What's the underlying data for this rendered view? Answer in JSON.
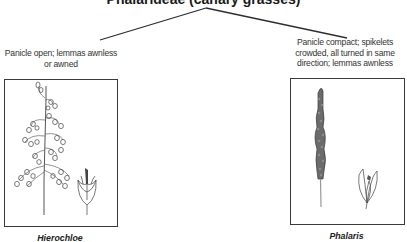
{
  "diagram": {
    "title": "Phalarideae (canary grasses)",
    "branches": [
      {
        "description_lines": [
          "Panicle open; lemmas awnless",
          "or awned"
        ],
        "genus": "Hierochloe"
      },
      {
        "description_lines": [
          "Panicle compact; spikelets",
          "crowded, all turned in same",
          "direction; lemmas awnless"
        ],
        "genus": "Phalaris"
      }
    ],
    "colors": {
      "line": "#2e2e2e",
      "box_border": "#3a3a3a",
      "text": "#333333"
    }
  }
}
